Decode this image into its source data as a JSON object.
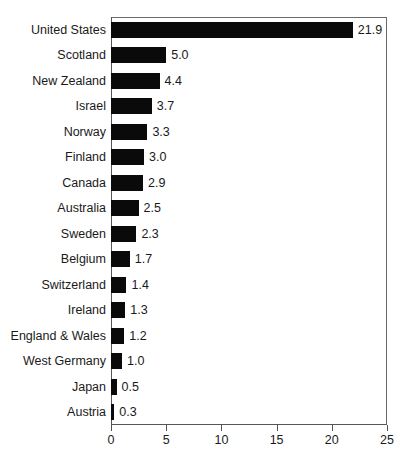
{
  "chart_data": {
    "type": "bar",
    "orientation": "horizontal",
    "title": "",
    "subtitle": "",
    "xlabel": "",
    "ylabel": "",
    "xlim": [
      0,
      25
    ],
    "ylim": null,
    "grid": false,
    "legend": null,
    "xticks": [
      "0",
      "5",
      "10",
      "15",
      "20",
      "25"
    ],
    "xtick_values": [
      0,
      5,
      10,
      15,
      20,
      25
    ],
    "bar_color": "#0a0a0a",
    "frame_color": "#555555",
    "background_color": "#ffffff",
    "categories": [
      "United States",
      "Scotland",
      "New Zealand",
      "Israel",
      "Norway",
      "Finland",
      "Canada",
      "Australia",
      "Sweden",
      "Belgium",
      "Switzerland",
      "Ireland",
      "England & Wales",
      "West Germany",
      "Japan",
      "Austria"
    ],
    "values": [
      21.9,
      5.0,
      4.4,
      3.7,
      3.3,
      3.0,
      2.9,
      2.5,
      2.3,
      1.7,
      1.4,
      1.3,
      1.2,
      1.0,
      0.5,
      0.3
    ],
    "value_labels": [
      "21.9",
      "5.0",
      "4.4",
      "3.7",
      "3.3",
      "3.0",
      "2.9",
      "2.5",
      "2.3",
      "1.7",
      "1.4",
      "1.3",
      "1.2",
      "1.0",
      "0.5",
      "0.3"
    ]
  }
}
